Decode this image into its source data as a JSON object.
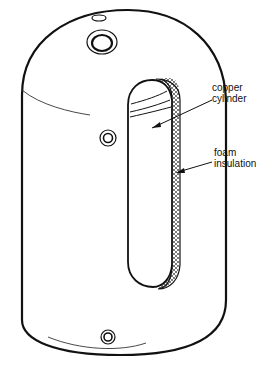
{
  "diagram": {
    "labels": [
      {
        "id": "copper",
        "line1": "copper",
        "line2": "cylinder"
      },
      {
        "id": "foam",
        "line1": "foam",
        "line2": "insulation"
      }
    ],
    "colors": {
      "stroke": "#111111",
      "background": "#ffffff"
    }
  }
}
